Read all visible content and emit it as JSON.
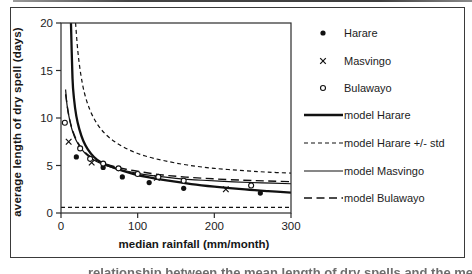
{
  "figure": {
    "caption_fragment": "relationship between the mean length of dry spells and the median monthly rainfall for Harare, Masvingo and Bulawayo"
  },
  "colors": {
    "ink": "#161616",
    "curve": "#111111",
    "axis": "#2b2b2b",
    "paper": "#ffffff"
  },
  "chart_data": {
    "type": "line",
    "title": "",
    "xlabel": "median rainfall (mm/month)",
    "ylabel": "average length of dry spell (days)",
    "xlim": [
      0,
      300
    ],
    "ylim": [
      0,
      20
    ],
    "x_ticks": [
      0,
      100,
      200,
      300
    ],
    "y_ticks": [
      0,
      5,
      10,
      15,
      20
    ],
    "grid": false,
    "legend_position": "right",
    "series": [
      {
        "name": "Harare",
        "kind": "scatter",
        "legend_marker": "filled-circle",
        "points": [
          [
            20,
            5.9
          ],
          [
            55,
            4.8
          ],
          [
            80,
            3.8
          ],
          [
            115,
            3.2
          ],
          [
            160,
            2.6
          ],
          [
            260,
            2.1
          ]
        ]
      },
      {
        "name": "Masvingo",
        "kind": "scatter",
        "legend_marker": "x",
        "points": [
          [
            10,
            7.5
          ],
          [
            40,
            5.3
          ],
          [
            125,
            3.7
          ],
          [
            215,
            2.5
          ]
        ]
      },
      {
        "name": "Bulawayo",
        "kind": "scatter",
        "legend_marker": "open-circle",
        "points": [
          [
            5,
            9.5
          ],
          [
            25,
            6.8
          ],
          [
            38,
            5.7
          ],
          [
            55,
            5.2
          ],
          [
            75,
            4.7
          ],
          [
            100,
            4.1
          ],
          [
            127,
            3.8
          ],
          [
            160,
            3.4
          ],
          [
            248,
            2.9
          ]
        ]
      },
      {
        "name": "model Harare",
        "kind": "line",
        "legend_marker": "solid-thick",
        "points": [
          [
            13,
            20
          ],
          [
            15,
            14.2
          ],
          [
            17,
            12
          ],
          [
            20,
            10.2
          ],
          [
            24,
            8.8
          ],
          [
            29,
            7.6
          ],
          [
            35,
            6.7
          ],
          [
            43,
            5.9
          ],
          [
            52,
            5.35
          ],
          [
            63,
            4.95
          ],
          [
            78,
            4.5
          ],
          [
            95,
            4.1
          ],
          [
            115,
            3.75
          ],
          [
            140,
            3.4
          ],
          [
            170,
            3.05
          ],
          [
            200,
            2.78
          ],
          [
            240,
            2.48
          ],
          [
            270,
            2.3
          ],
          [
            300,
            2.15
          ]
        ]
      },
      {
        "name": "model Harare +/- std",
        "kind": "line",
        "legend_marker": "dash-short",
        "points": [
          [
            19,
            20
          ],
          [
            22,
            17
          ],
          [
            26,
            14.5
          ],
          [
            31,
            12.5
          ],
          [
            38,
            10.8
          ],
          [
            47,
            9.4
          ],
          [
            58,
            8.3
          ],
          [
            72,
            7.4
          ],
          [
            90,
            6.6
          ],
          [
            110,
            6.0
          ],
          [
            135,
            5.5
          ],
          [
            165,
            5.05
          ],
          [
            200,
            4.7
          ],
          [
            240,
            4.45
          ],
          [
            270,
            4.3
          ],
          [
            300,
            4.2
          ]
        ],
        "points_lower": [
          [
            0,
            0.6
          ],
          [
            300,
            0.6
          ]
        ]
      },
      {
        "name": "model Masvingo",
        "kind": "line",
        "legend_marker": "solid-thin",
        "points": [
          [
            6,
            13
          ],
          [
            8,
            11.3
          ],
          [
            11,
            9.9
          ],
          [
            15,
            8.6
          ],
          [
            20,
            7.6
          ],
          [
            27,
            6.7
          ],
          [
            36,
            5.95
          ],
          [
            47,
            5.4
          ],
          [
            60,
            4.95
          ],
          [
            78,
            4.55
          ],
          [
            98,
            4.2
          ],
          [
            122,
            3.9
          ],
          [
            150,
            3.65
          ],
          [
            185,
            3.45
          ],
          [
            225,
            3.28
          ],
          [
            262,
            3.17
          ],
          [
            300,
            3.08
          ]
        ]
      },
      {
        "name": "model Bulawayo",
        "kind": "line",
        "legend_marker": "dash-long",
        "points": [
          [
            6,
            12.5
          ],
          [
            9,
            10.8
          ],
          [
            12,
            9.6
          ],
          [
            16,
            8.5
          ],
          [
            22,
            7.4
          ],
          [
            30,
            6.5
          ],
          [
            40,
            5.85
          ],
          [
            52,
            5.35
          ],
          [
            67,
            4.95
          ],
          [
            85,
            4.6
          ],
          [
            107,
            4.3
          ],
          [
            133,
            4.0
          ],
          [
            163,
            3.78
          ],
          [
            198,
            3.6
          ],
          [
            237,
            3.45
          ],
          [
            270,
            3.37
          ],
          [
            300,
            3.3
          ]
        ]
      }
    ]
  }
}
